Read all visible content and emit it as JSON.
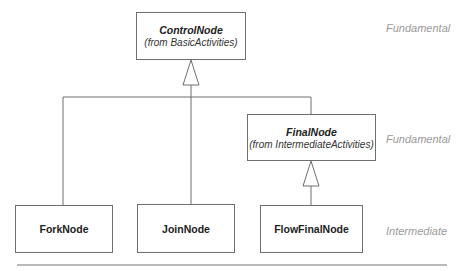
{
  "diagram": {
    "type": "uml-class-generalization",
    "classes": [
      {
        "id": "control",
        "name": "ControlNode",
        "from": "(from BasicActivities)",
        "abstract": true
      },
      {
        "id": "final",
        "name": "FinalNode",
        "from": "(from IntermediateActivities)",
        "abstract": true
      },
      {
        "id": "fork",
        "name": "ForkNode",
        "abstract": false
      },
      {
        "id": "join",
        "name": "JoinNode",
        "abstract": false
      },
      {
        "id": "flowfinal",
        "name": "FlowFinalNode",
        "abstract": false
      }
    ],
    "generalizations": [
      {
        "child": "fork",
        "parent": "control"
      },
      {
        "child": "join",
        "parent": "control"
      },
      {
        "child": "final",
        "parent": "control"
      },
      {
        "child": "flowfinal",
        "parent": "final"
      }
    ],
    "package_labels": {
      "control": "Fundamental",
      "final": "Fundamental",
      "bottom_row": "Intermediate"
    }
  }
}
